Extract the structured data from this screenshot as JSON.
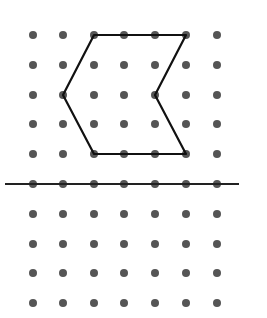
{
  "diagram": {
    "type": "dot-grid-reflection",
    "grid": {
      "columns_x": [
        33,
        63,
        94,
        124,
        155,
        186,
        217
      ],
      "rows_y": [
        35,
        65,
        95,
        124,
        154,
        184,
        214,
        244,
        273,
        303
      ],
      "dot_radius": 4,
      "dot_color": "#555555"
    },
    "shape": {
      "name": "chevron-hexagon",
      "vertices": [
        [
          94,
          35
        ],
        [
          186,
          35
        ],
        [
          155,
          95
        ],
        [
          186,
          154
        ],
        [
          94,
          154
        ],
        [
          63,
          95
        ]
      ],
      "grid_vertices": [
        [
          2,
          0
        ],
        [
          5,
          0
        ],
        [
          4,
          2
        ],
        [
          5,
          4
        ],
        [
          2,
          4
        ],
        [
          1,
          2
        ]
      ],
      "stroke": "#111111",
      "stroke_width": 2.2
    },
    "mirror_line": {
      "name": "line-of-reflection",
      "x1": 5,
      "y1": 184,
      "x2": 239,
      "y2": 184,
      "grid_row": 5,
      "stroke": "#222222",
      "stroke_width": 2.2
    }
  }
}
